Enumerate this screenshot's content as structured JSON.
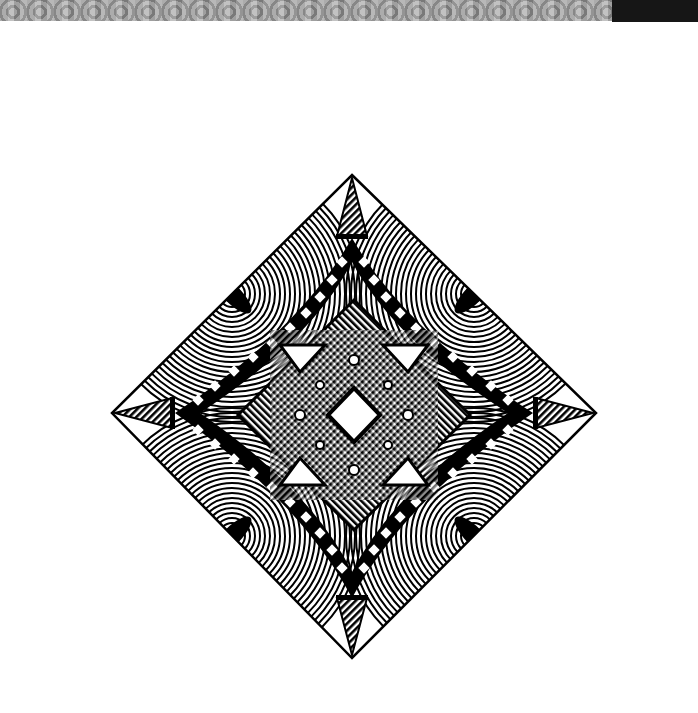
{
  "image": {
    "description": "Ink drawing of a Zentangle-style diamond mandala on white paper",
    "background": "#ffffff",
    "ink": "#000000",
    "top_band_color": "#a0a0a0",
    "top_right_block_color": "#161616"
  },
  "diamond": {
    "top": [
      352,
      175
    ],
    "right": [
      596,
      413
    ],
    "bottom": [
      352,
      658
    ],
    "left": [
      112,
      413
    ],
    "center": [
      354,
      415
    ]
  }
}
